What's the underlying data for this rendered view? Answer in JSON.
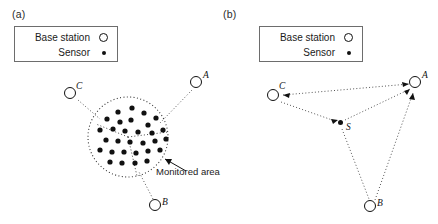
{
  "figure": {
    "type": "wireless-sensor-network-diagram",
    "panels": [
      {
        "id": "a",
        "label": "(a)",
        "legend": {
          "items": [
            {
              "label": "Base station",
              "symbol": "hollow-circle"
            },
            {
              "label": "Sensor",
              "symbol": "filled-dot"
            }
          ]
        },
        "annotation": "Monitored area",
        "base_stations": [
          {
            "id": "A",
            "label": "A",
            "x": 196,
            "y": 82
          },
          {
            "id": "B",
            "label": "B",
            "x": 155,
            "y": 205
          },
          {
            "id": "C",
            "label": "C",
            "x": 70,
            "y": 93
          }
        ],
        "monitored_area": {
          "cx": 128,
          "cy": 137,
          "r": 40,
          "style": "dotted-circle"
        },
        "sensor_count": 30,
        "sensors": [
          [
            118,
            112
          ],
          [
            132,
            108
          ],
          [
            144,
            113
          ],
          [
            156,
            118
          ],
          [
            107,
            119
          ],
          [
            120,
            122
          ],
          [
            131,
            120
          ],
          [
            148,
            125
          ],
          [
            100,
            130
          ],
          [
            113,
            129
          ],
          [
            125,
            131
          ],
          [
            138,
            132
          ],
          [
            152,
            133
          ],
          [
            163,
            130
          ],
          [
            106,
            140
          ],
          [
            118,
            141
          ],
          [
            130,
            142
          ],
          [
            143,
            143
          ],
          [
            155,
            141
          ],
          [
            166,
            139
          ],
          [
            100,
            150
          ],
          [
            112,
            152
          ],
          [
            124,
            152
          ],
          [
            136,
            153
          ],
          [
            148,
            151
          ],
          [
            160,
            150
          ],
          [
            110,
            162
          ],
          [
            122,
            163
          ],
          [
            135,
            163
          ],
          [
            147,
            161
          ]
        ],
        "sector_lines": [
          {
            "from": [
              128,
              137
            ],
            "to": [
              96,
              124
            ]
          },
          {
            "from": [
              128,
              137
            ],
            "to": [
              168,
              132
            ]
          },
          {
            "from": [
              128,
              137
            ],
            "to": [
              137,
              176
            ]
          }
        ],
        "links": [
          {
            "from": "C",
            "to": "area"
          },
          {
            "from": "A",
            "to": "area"
          },
          {
            "from": "B",
            "to": "area"
          }
        ]
      },
      {
        "id": "b",
        "label": "(b)",
        "legend": {
          "items": [
            {
              "label": "Base station",
              "symbol": "hollow-circle"
            },
            {
              "label": "Sensor",
              "symbol": "filled-dot"
            }
          ]
        },
        "base_stations": [
          {
            "id": "A",
            "label": "A",
            "x": 196,
            "y": 82
          },
          {
            "id": "B",
            "label": "B",
            "x": 151,
            "y": 206
          },
          {
            "id": "C",
            "label": "C",
            "x": 54,
            "y": 95
          }
        ],
        "sensor_node": {
          "id": "S",
          "label": "S",
          "x": 122,
          "y": 123
        },
        "links": [
          {
            "from": "C",
            "to": "A",
            "arrow": "both"
          },
          {
            "from": "C",
            "to": "S",
            "arrow": "to-S"
          },
          {
            "from": "S",
            "to": "A",
            "arrow": "to-A"
          },
          {
            "from": "S",
            "to": "B",
            "arrow": "none"
          },
          {
            "from": "B",
            "to": "A",
            "arrow": "to-A"
          }
        ]
      }
    ]
  },
  "style": {
    "line_color": "#555555",
    "node_stroke": "#111111",
    "sensor_fill": "#111111",
    "background": "#ffffff"
  }
}
